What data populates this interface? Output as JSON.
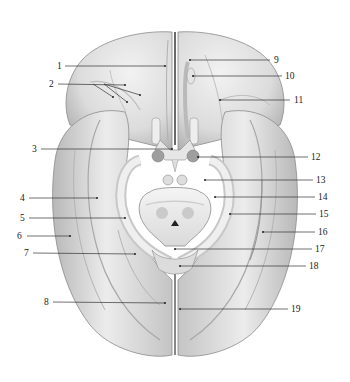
{
  "figure": {
    "colors": {
      "background": "#ffffff",
      "tissue_light": "#f0f0f0",
      "tissue_mid": "#d4d4d4",
      "tissue_dark": "#9a9a9a",
      "leader_line": "#333333",
      "label_text": "#222222"
    },
    "labels_left": [
      {
        "id": "1",
        "text": "1",
        "x": 57,
        "y": 66
      },
      {
        "id": "2",
        "text": "2",
        "x": 49,
        "y": 84
      },
      {
        "id": "3",
        "text": "3",
        "x": 32,
        "y": 149
      },
      {
        "id": "4",
        "text": "4",
        "x": 20,
        "y": 198
      },
      {
        "id": "5",
        "text": "5",
        "x": 20,
        "y": 218
      },
      {
        "id": "6",
        "text": "6",
        "x": 17,
        "y": 236
      },
      {
        "id": "7",
        "text": "7",
        "x": 24,
        "y": 253
      },
      {
        "id": "8",
        "text": "8",
        "x": 44,
        "y": 302
      }
    ],
    "labels_right": [
      {
        "id": "9",
        "text": "9",
        "x": 274,
        "y": 60
      },
      {
        "id": "10",
        "text": "10",
        "x": 285,
        "y": 76
      },
      {
        "id": "11",
        "text": "11",
        "x": 294,
        "y": 100
      },
      {
        "id": "12",
        "text": "12",
        "x": 311,
        "y": 157
      },
      {
        "id": "13",
        "text": "13",
        "x": 316,
        "y": 180
      },
      {
        "id": "14",
        "text": "14",
        "x": 318,
        "y": 197
      },
      {
        "id": "15",
        "text": "15",
        "x": 319,
        "y": 214
      },
      {
        "id": "16",
        "text": "16",
        "x": 318,
        "y": 232
      },
      {
        "id": "17",
        "text": "17",
        "x": 315,
        "y": 249
      },
      {
        "id": "18",
        "text": "18",
        "x": 309,
        "y": 266
      },
      {
        "id": "19",
        "text": "19",
        "x": 291,
        "y": 309
      }
    ]
  }
}
